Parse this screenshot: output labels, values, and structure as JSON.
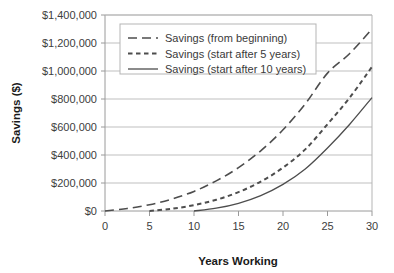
{
  "chart_data": {
    "type": "line",
    "title": "",
    "xlabel": "Years Working",
    "ylabel": "Savings ($)",
    "xlim": [
      0,
      30
    ],
    "ylim": [
      0,
      1400000
    ],
    "grid": true,
    "legend_position": "top-left-inside",
    "x_ticks": [
      "0",
      "5",
      "10",
      "15",
      "20",
      "25",
      "30"
    ],
    "x_tick_values": [
      0,
      5,
      10,
      15,
      20,
      25,
      30
    ],
    "y_ticks": [
      "$0",
      "$200,000",
      "$400,000",
      "$600,000",
      "$800,000",
      "$1,000,000",
      "$1,200,000",
      "$1,400,000"
    ],
    "y_tick_values": [
      0,
      200000,
      400000,
      600000,
      800000,
      1000000,
      1200000,
      1400000
    ],
    "x": [
      0,
      5,
      10,
      15,
      20,
      25,
      30
    ],
    "series": [
      {
        "name": "Savings (from beginning)",
        "style": "dashed",
        "color": "#4d4d4d",
        "start_year": 0,
        "x": [
          0,
          2.5,
          5,
          7.5,
          10,
          12.5,
          15,
          17.5,
          20,
          22.5,
          25,
          27.5,
          30
        ],
        "values": [
          0,
          18000,
          45000,
          85000,
          140000,
          215000,
          310000,
          430000,
          580000,
          765000,
          985000,
          1125000,
          1300000
        ]
      },
      {
        "name": "Savings (start after 5 years)",
        "style": "dotted",
        "color": "#4d4d4d",
        "start_year": 5,
        "x": [
          5,
          7.5,
          10,
          12.5,
          15,
          17.5,
          20,
          22.5,
          25,
          27.5,
          30
        ],
        "values": [
          0,
          16000,
          42000,
          80000,
          135000,
          210000,
          310000,
          440000,
          620000,
          810000,
          1030000
        ]
      },
      {
        "name": "Savings (start after 10 years)",
        "style": "solid",
        "color": "#4d4d4d",
        "start_year": 10,
        "x": [
          10,
          12.5,
          15,
          17.5,
          20,
          22.5,
          25,
          27.5,
          30
        ],
        "values": [
          0,
          20000,
          55000,
          110000,
          190000,
          300000,
          450000,
          620000,
          810000
        ]
      }
    ]
  },
  "legend": {
    "items": [
      {
        "label": "Savings (from beginning)",
        "style": "dashed"
      },
      {
        "label": "Savings (start after 5 years)",
        "style": "dotted"
      },
      {
        "label": "Savings (start after 10 years)",
        "style": "solid"
      }
    ]
  },
  "colors": {
    "line": "#4d4d4d",
    "grid": "#b8b8b8",
    "axis": "#9a9a9a",
    "text": "#3a3a3a",
    "background": "#ffffff"
  }
}
